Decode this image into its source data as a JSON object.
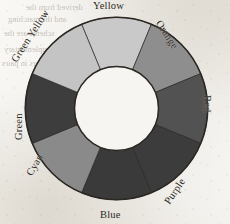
{
  "figure": {
    "type": "color-wheel-diagram",
    "segment_count": 8,
    "background_hex": "#eeebe4",
    "hub_hex": "#f7f5f1",
    "outline_hex": "#2b2722"
  },
  "bleed_through": {
    "line_a": "derived from the",
    "line_b": "and the matching",
    "line_c": "scheme are the",
    "line_d": "complementary",
    "line_e": "colors in pairs",
    "center": "triangle"
  },
  "chart_data": {
    "type": "pie",
    "subtitle": "",
    "xlabel": "",
    "ylabel": "",
    "legend_position": "around-ring",
    "grid": false,
    "inner_radius_ratio": 0.46,
    "start_angle_deg": -22.5,
    "categories": [
      "Yellow",
      "Orange",
      "Red",
      "Purple",
      "Blue",
      "Cyan",
      "Green",
      "Green Yellow"
    ],
    "values": [
      45,
      45,
      45,
      45,
      45,
      45,
      45,
      45
    ],
    "annotations": [
      "Yellow",
      "Orange",
      "Red",
      "Purple",
      "Blue",
      "Cyan",
      "Green",
      "Green Yellow"
    ],
    "series": [
      {
        "name": "Wedge angular size (degrees)",
        "values": [
          45,
          45,
          45,
          45,
          45,
          45,
          45,
          45
        ]
      }
    ],
    "slices": [
      {
        "label": "Yellow",
        "angle_deg": 45,
        "start_deg": -22.5,
        "end_deg": 22.5,
        "fill_hex": "#c9c9c9",
        "label_position": "top"
      },
      {
        "label": "Orange",
        "angle_deg": 45,
        "start_deg": 22.5,
        "end_deg": 67.5,
        "fill_hex": "#8e8e8e",
        "label_position": "upper-right"
      },
      {
        "label": "Red",
        "angle_deg": 45,
        "start_deg": 67.5,
        "end_deg": 112.5,
        "fill_hex": "#525252",
        "label_position": "right"
      },
      {
        "label": "Purple",
        "angle_deg": 45,
        "start_deg": 112.5,
        "end_deg": 157.5,
        "fill_hex": "#3c3c3c",
        "label_position": "lower-right"
      },
      {
        "label": "Blue",
        "angle_deg": 45,
        "start_deg": 157.5,
        "end_deg": 202.5,
        "fill_hex": "#3a3a3a",
        "label_position": "bottom"
      },
      {
        "label": "Cyan",
        "angle_deg": 45,
        "start_deg": 202.5,
        "end_deg": 247.5,
        "fill_hex": "#8a8a8a",
        "label_position": "lower-left"
      },
      {
        "label": "Green",
        "angle_deg": 45,
        "start_deg": 247.5,
        "end_deg": 292.5,
        "fill_hex": "#3d3d3d",
        "label_position": "left"
      },
      {
        "label": "Green Yellow",
        "angle_deg": 45,
        "start_deg": 292.5,
        "end_deg": 337.5,
        "fill_hex": "#c4c4c4",
        "label_position": "upper-left"
      }
    ]
  }
}
